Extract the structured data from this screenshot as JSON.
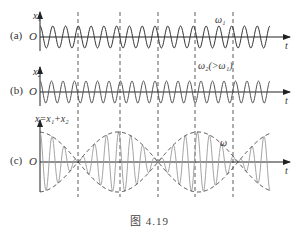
{
  "figure": {
    "caption": "图 4.19",
    "panels": [
      {
        "id": "a",
        "label": "(a)",
        "y_axis": "x₁",
        "origin": "O",
        "t_axis": "t",
        "annotation": "ω₁",
        "frequency": "ω₁",
        "cycles": 18
      },
      {
        "id": "b",
        "label": "(b)",
        "y_axis": "x₂",
        "origin": "O",
        "t_axis": "t",
        "annotation": "ω₂(>ω₁)",
        "frequency": "ω₂",
        "cycles": 20
      },
      {
        "id": "c",
        "label": "(c)",
        "y_axis": "x=x₁+x₂",
        "origin": "O",
        "t_axis": "t",
        "annotation": "ω",
        "description": "beat pattern: sum of x1 and x2 with dashed amplitude envelope"
      }
    ],
    "dashed_guides_x": [
      78,
      120,
      158,
      195,
      233
    ],
    "colors": {
      "axis": "#222222",
      "wave_a": "#333333",
      "wave_b": "#555555",
      "wave_c": "#9a9a9a",
      "envelope": "#333333",
      "guide": "#333333"
    }
  }
}
